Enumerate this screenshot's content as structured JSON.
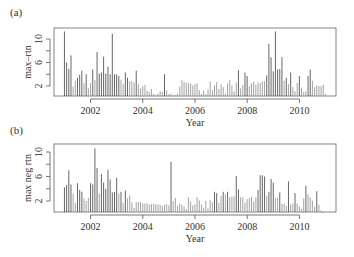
{
  "chart_data": [
    {
      "type": "bar",
      "panel_label": "(a)",
      "title": "",
      "xlabel": "Year",
      "ylabel": "max–rtn",
      "xlim": [
        2000.6,
        2011.4
      ],
      "ylim": [
        0,
        11.5
      ],
      "xticks": [
        2002,
        2004,
        2006,
        2008,
        2010
      ],
      "yticks": [
        2,
        6,
        10
      ],
      "minor_yticks": [
        4,
        8
      ],
      "grid": false,
      "x_start": 2001.0,
      "x_step": 0.0833,
      "values": [
        11.3,
        6.0,
        4.9,
        7.2,
        1.9,
        2.9,
        3.4,
        3.9,
        4.6,
        2.5,
        4.0,
        1.6,
        2.5,
        4.8,
        3.0,
        7.8,
        4.1,
        4.3,
        7.0,
        4.1,
        5.3,
        4.0,
        10.9,
        4.0,
        4.0,
        3.7,
        3.1,
        2.4,
        4.3,
        3.4,
        2.8,
        2.8,
        2.6,
        4.6,
        2.3,
        1.6,
        2.0,
        2.2,
        1.2,
        1.0,
        1.5,
        0.7,
        0.4,
        0.7,
        1.1,
        1.0,
        4.0,
        1.3,
        0.6,
        0.7,
        0.4,
        0.5,
        0.7,
        1.9,
        3.0,
        2.7,
        2.6,
        2.5,
        2.4,
        2.1,
        2.3,
        2.5,
        1.3,
        0.6,
        1.2,
        0.6,
        1.4,
        2.8,
        1.3,
        2.1,
        2.7,
        1.5,
        2.3,
        1.8,
        0.7,
        2.4,
        3.0,
        2.1,
        1.1,
        2.6,
        4.7,
        1.6,
        2.2,
        4.3,
        3.7,
        2.0,
        2.4,
        2.7,
        2.2,
        2.6,
        2.5,
        2.8,
        2.8,
        3.8,
        9.2,
        6.9,
        4.5,
        11.3,
        4.8,
        4.9,
        6.9,
        2.9,
        3.4,
        2.3,
        4.3,
        1.8,
        1.1,
        2.5,
        3.7,
        1.7,
        1.0,
        1.1,
        3.7,
        4.8,
        2.9,
        1.8,
        2.1,
        2.0,
        2.0,
        2.2,
        0.6
      ]
    },
    {
      "type": "bar",
      "panel_label": "(b)",
      "title": "",
      "xlabel": "Year",
      "ylabel": "max neg rtn",
      "xlim": [
        2000.6,
        2011.4
      ],
      "ylim": [
        0,
        11.5
      ],
      "xticks": [
        2002,
        2004,
        2006,
        2008,
        2010
      ],
      "yticks": [
        2,
        6,
        10
      ],
      "minor_yticks": [
        4,
        8
      ],
      "grid": false,
      "x_start": 2001.0,
      "x_step": 0.0833,
      "values": [
        4.2,
        4.6,
        7.0,
        4.7,
        3.2,
        1.7,
        4.9,
        3.8,
        3.5,
        2.4,
        2.0,
        2.5,
        4.9,
        4.7,
        10.6,
        7.4,
        3.2,
        6.4,
        5.0,
        4.0,
        7.1,
        5.5,
        3.4,
        3.5,
        5.8,
        3.2,
        3.5,
        1.7,
        3.7,
        2.4,
        2.9,
        1.8,
        0.9,
        1.8,
        1.8,
        1.8,
        1.6,
        1.6,
        1.6,
        1.4,
        1.5,
        1.5,
        1.5,
        1.4,
        1.4,
        1.2,
        1.4,
        1.5,
        1.3,
        8.4,
        2.0,
        2.5,
        1.2,
        1.6,
        1.4,
        1.1,
        0.7,
        2.6,
        1.9,
        1.3,
        1.5,
        2.6,
        2.1,
        1.4,
        0.9,
        2.0,
        0.8,
        2.2,
        1.8,
        3.5,
        3.3,
        1.7,
        2.8,
        3.5,
        3.1,
        3.5,
        2.6,
        2.7,
        2.8,
        6.1,
        3.9,
        2.6,
        2.6,
        1.7,
        2.3,
        2.5,
        2.7,
        1.9,
        2.6,
        3.8,
        6.2,
        6.2,
        6.0,
        2.8,
        3.5,
        5.6,
        5.0,
        2.5,
        2.5,
        3.4,
        1.5,
        1.6,
        1.2,
        5.2,
        1.4,
        1.6,
        3.3,
        1.6,
        1.1,
        0.7,
        2.4,
        4.5,
        3.1,
        2.6,
        2.1,
        1.1,
        3.6,
        1.4,
        0.5,
        0.0
      ]
    }
  ]
}
